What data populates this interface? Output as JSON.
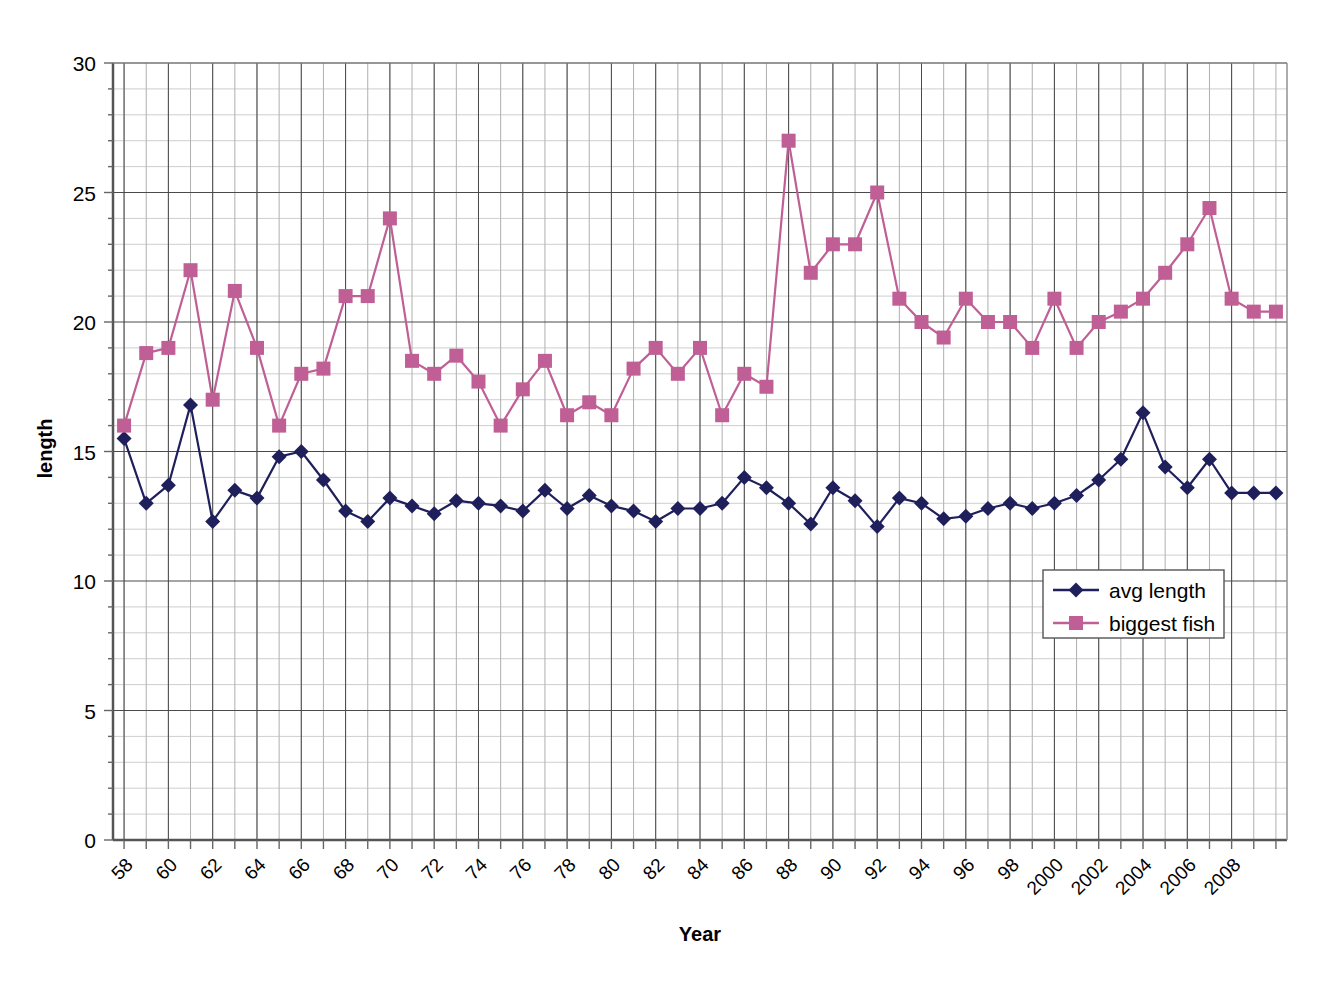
{
  "chart_data": {
    "type": "line",
    "title": "",
    "xlabel": "Year",
    "ylabel": "length",
    "xlim": [
      1957.5,
      2010.5
    ],
    "ylim": [
      0,
      30
    ],
    "ytick_step": 5,
    "yticks": [
      0,
      5,
      10,
      15,
      20,
      25,
      30
    ],
    "ytick_labels": [
      "0",
      "5",
      "10",
      "15",
      "20",
      "25",
      "30"
    ],
    "minor_grid_step": 1,
    "grid": true,
    "legend_position": "lower-right",
    "xtick_step": 2,
    "xtick_labels": [
      "58",
      "60",
      "62",
      "64",
      "66",
      "68",
      "70",
      "72",
      "74",
      "76",
      "78",
      "80",
      "82",
      "84",
      "86",
      "88",
      "90",
      "92",
      "94",
      "96",
      "98",
      "2000",
      "2002",
      "2004",
      "2006",
      "2008"
    ],
    "xtick_years": [
      1958,
      1960,
      1962,
      1964,
      1966,
      1968,
      1970,
      1972,
      1974,
      1976,
      1978,
      1980,
      1982,
      1984,
      1986,
      1988,
      1990,
      1992,
      1994,
      1996,
      1998,
      2000,
      2002,
      2004,
      2006,
      2008
    ],
    "xtick_rotation_deg": 45,
    "x": [
      1958,
      1959,
      1960,
      1961,
      1962,
      1963,
      1964,
      1965,
      1966,
      1967,
      1968,
      1969,
      1970,
      1971,
      1972,
      1973,
      1974,
      1975,
      1976,
      1977,
      1978,
      1979,
      1980,
      1981,
      1982,
      1983,
      1984,
      1985,
      1986,
      1987,
      1988,
      1989,
      1990,
      1991,
      1992,
      1993,
      1994,
      1995,
      1996,
      1997,
      1998,
      1999,
      2000,
      2001,
      2002,
      2003,
      2004,
      2005,
      2006,
      2007,
      2008,
      2009,
      2010
    ],
    "series": [
      {
        "name": "avg length",
        "color": "#1f1f5c",
        "marker": "diamond",
        "values": [
          15.5,
          13.0,
          13.7,
          16.8,
          12.3,
          13.5,
          13.2,
          14.8,
          15.0,
          13.9,
          12.7,
          12.3,
          13.2,
          12.9,
          12.6,
          13.1,
          13.0,
          12.9,
          12.7,
          13.5,
          12.8,
          13.3,
          12.9,
          12.7,
          12.3,
          12.8,
          12.8,
          13.0,
          14.0,
          13.6,
          13.0,
          12.2,
          13.6,
          13.1,
          12.1,
          13.2,
          13.0,
          12.4,
          12.5,
          12.8,
          13.0,
          12.8,
          13.0,
          13.3,
          13.9,
          14.7,
          16.5,
          14.4,
          13.6,
          14.7,
          13.4,
          13.4,
          13.4
        ]
      },
      {
        "name": "biggest fish",
        "color": "#bf5f95",
        "marker": "square",
        "values": [
          16.0,
          18.8,
          19.0,
          22.0,
          17.0,
          21.2,
          19.0,
          16.0,
          18.0,
          18.2,
          21.0,
          21.0,
          24.0,
          18.5,
          18.0,
          18.7,
          17.7,
          16.0,
          17.4,
          18.5,
          16.4,
          16.9,
          16.4,
          18.2,
          19.0,
          18.0,
          19.0,
          16.4,
          18.0,
          17.5,
          27.0,
          21.9,
          23.0,
          23.0,
          25.0,
          20.9,
          20.0,
          19.4,
          20.9,
          20.0,
          20.0,
          19.0,
          20.9,
          19.0,
          20.0,
          20.4,
          20.9,
          21.9,
          23.0,
          24.4,
          20.9,
          20.4,
          20.4
        ]
      }
    ]
  },
  "legend": {
    "items": [
      {
        "label": "avg length",
        "color": "#1f1f5c",
        "marker": "diamond"
      },
      {
        "label": "biggest fish",
        "color": "#bf5f95",
        "marker": "square"
      }
    ]
  },
  "axes": {
    "y_title": "length",
    "x_title": "Year"
  }
}
